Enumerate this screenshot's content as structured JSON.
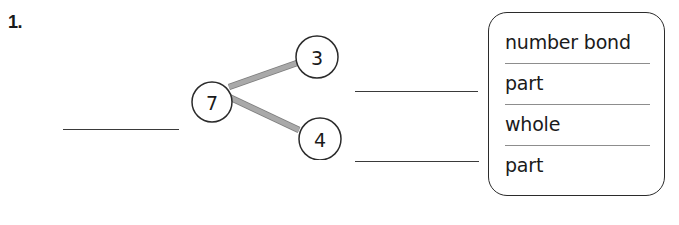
{
  "worksheet": {
    "problem_number": "1.",
    "number_bond": {
      "whole": "7",
      "parts": [
        "3",
        "4"
      ],
      "connector_color": "#a9a9a9",
      "circle_stroke_color": "#2b2b2b"
    },
    "blanks": [
      {
        "name": "whole-blank",
        "value": ""
      },
      {
        "name": "part-blank-top",
        "value": ""
      },
      {
        "name": "part-blank-bottom",
        "value": ""
      }
    ],
    "word_bank": {
      "items": [
        {
          "label": "number bond"
        },
        {
          "label": "part"
        },
        {
          "label": "whole"
        },
        {
          "label": "part"
        }
      ],
      "border_color": "#2b2b2b",
      "divider_color": "#8d8d8d"
    }
  }
}
